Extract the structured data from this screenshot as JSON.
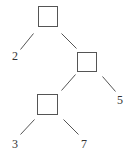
{
  "diagram": {
    "type": "binary-tree",
    "internal_nodes": [
      {
        "id": "root",
        "x": 38,
        "y": 6,
        "w": 19,
        "h": 20
      },
      {
        "id": "n1",
        "x": 77,
        "y": 52,
        "w": 19,
        "h": 19
      },
      {
        "id": "n2",
        "x": 37,
        "y": 94,
        "w": 20,
        "h": 20
      }
    ],
    "edges": [
      {
        "from": "root",
        "to": "leaf-2",
        "x1": 33,
        "y1": 33,
        "x2": 20,
        "y2": 49
      },
      {
        "from": "root",
        "to": "n1",
        "x1": 61,
        "y1": 33,
        "x2": 76,
        "y2": 48
      },
      {
        "from": "n1",
        "to": "n2",
        "x1": 75,
        "y1": 74,
        "x2": 61,
        "y2": 90
      },
      {
        "from": "n1",
        "to": "leaf-5",
        "x1": 102,
        "y1": 76,
        "x2": 115,
        "y2": 91
      },
      {
        "from": "n2",
        "to": "leaf-3",
        "x1": 34,
        "y1": 119,
        "x2": 20,
        "y2": 134
      },
      {
        "from": "n2",
        "to": "leaf-7",
        "x1": 63,
        "y1": 119,
        "x2": 78,
        "y2": 134
      }
    ],
    "leaves": [
      {
        "id": "leaf-2",
        "label": "2",
        "x": 12,
        "y": 60
      },
      {
        "id": "leaf-5",
        "label": "5",
        "x": 117,
        "y": 104
      },
      {
        "id": "leaf-3",
        "label": "3",
        "x": 12,
        "y": 148
      },
      {
        "id": "leaf-7",
        "label": "7",
        "x": 81,
        "y": 148
      }
    ]
  }
}
